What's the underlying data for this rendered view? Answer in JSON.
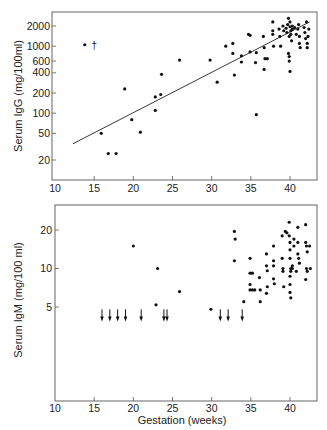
{
  "chart_data": [
    {
      "type": "scatter",
      "panel": "upper",
      "title": "",
      "xlabel": "",
      "ylabel": "Serum IgG (mg/100ml)",
      "xscale": "linear",
      "yscale": "log",
      "xlim": [
        10,
        43
      ],
      "ylim": [
        10,
        3000
      ],
      "xticks": [
        10,
        15,
        20,
        25,
        30,
        35,
        40
      ],
      "yticks": [
        20,
        50,
        100,
        200,
        400,
        600,
        1000,
        2000
      ],
      "grid": false,
      "legend": null,
      "annotations": [
        {
          "text": "†",
          "x": 14.5,
          "y": 1050,
          "note": "dagger mark next to point at ~14 weeks"
        }
      ],
      "regression_line": {
        "from": [
          12.3,
          35
        ],
        "to": [
          42.5,
          2300
        ]
      },
      "points": [
        [
          13.8,
          1050
        ],
        [
          15.9,
          50
        ],
        [
          16.8,
          25
        ],
        [
          17.8,
          25
        ],
        [
          18.9,
          230
        ],
        [
          19.8,
          80
        ],
        [
          20.9,
          52
        ],
        [
          22.8,
          175
        ],
        [
          22.8,
          110
        ],
        [
          23.6,
          380
        ],
        [
          23.5,
          190
        ],
        [
          25.9,
          620
        ],
        [
          29.8,
          620
        ],
        [
          30.7,
          290
        ],
        [
          31.8,
          1000
        ],
        [
          32.7,
          1100
        ],
        [
          32.7,
          780
        ],
        [
          32.9,
          370
        ],
        [
          33.8,
          720
        ],
        [
          33.8,
          580
        ],
        [
          34.7,
          1500
        ],
        [
          34.9,
          1450
        ],
        [
          34.9,
          820
        ],
        [
          35.6,
          570
        ],
        [
          35.7,
          800
        ],
        [
          35.7,
          95
        ],
        [
          36.6,
          1400
        ],
        [
          36.7,
          950
        ],
        [
          36.8,
          650
        ],
        [
          36.7,
          450
        ],
        [
          37.1,
          650
        ],
        [
          37.8,
          2300
        ],
        [
          37.8,
          1700
        ],
        [
          37.8,
          1500
        ],
        [
          37.9,
          1000
        ],
        [
          38.6,
          1800
        ],
        [
          38.7,
          1400
        ],
        [
          38.8,
          1000
        ],
        [
          39.1,
          2000
        ],
        [
          39.2,
          1700
        ],
        [
          39.5,
          1850
        ],
        [
          39.6,
          1600
        ],
        [
          39.7,
          2100
        ],
        [
          39.8,
          2600
        ],
        [
          39.9,
          1400
        ],
        [
          40.0,
          2300
        ],
        [
          40.0,
          1950
        ],
        [
          40.1,
          1700
        ],
        [
          40.1,
          1500
        ],
        [
          40.2,
          1200
        ],
        [
          40.3,
          2000
        ],
        [
          40.3,
          1800
        ],
        [
          39.9,
          600
        ],
        [
          39.9,
          700
        ],
        [
          40.0,
          420
        ],
        [
          39.8,
          780
        ],
        [
          40.6,
          1900
        ],
        [
          40.8,
          1500
        ],
        [
          41.0,
          1800
        ],
        [
          41.1,
          2100
        ],
        [
          41.2,
          1400
        ],
        [
          41.2,
          1100
        ],
        [
          41.3,
          950
        ],
        [
          41.8,
          1900
        ],
        [
          41.9,
          1600
        ],
        [
          42.0,
          1300
        ],
        [
          42.1,
          2300
        ],
        [
          42.2,
          1100
        ],
        [
          42.2,
          950
        ],
        [
          42.3,
          1400
        ],
        [
          42.4,
          1800
        ]
      ]
    },
    {
      "type": "scatter",
      "panel": "lower",
      "title": "",
      "xlabel": "Gestation (weeks)",
      "ylabel": "Serum IgM (mg/100 ml)",
      "xscale": "linear",
      "yscale": "log",
      "xlim": [
        10,
        43
      ],
      "ylim": [
        0.6,
        30
      ],
      "xticks": [
        10,
        15,
        20,
        25,
        30,
        35,
        40
      ],
      "yticks": [
        5,
        10,
        20
      ],
      "grid": false,
      "legend": null,
      "below_detection_arrows_x": [
        16,
        17,
        18,
        19,
        21,
        23.9,
        24.3,
        31.1,
        32.1,
        33.9
      ],
      "below_detection_level": 4.3,
      "points": [
        [
          20.0,
          15
        ],
        [
          23.1,
          10
        ],
        [
          22.9,
          5.2
        ],
        [
          25.9,
          6.6
        ],
        [
          29.9,
          4.8
        ],
        [
          32.9,
          19.5
        ],
        [
          33.0,
          17
        ],
        [
          32.9,
          11.5
        ],
        [
          34.1,
          5.5
        ],
        [
          34.9,
          12
        ],
        [
          34.9,
          9.2
        ],
        [
          35.2,
          9.2
        ],
        [
          34.9,
          7.5
        ],
        [
          34.9,
          6.8
        ],
        [
          35.2,
          6.8
        ],
        [
          35.5,
          6.8
        ],
        [
          36.1,
          8.5
        ],
        [
          36.2,
          6.8
        ],
        [
          36.2,
          5.5
        ],
        [
          37.0,
          13
        ],
        [
          37.0,
          10.5
        ],
        [
          37.1,
          9.6
        ],
        [
          37.1,
          7.2
        ],
        [
          37.0,
          6.4
        ],
        [
          37.9,
          15
        ],
        [
          37.9,
          11.5
        ],
        [
          37.9,
          10.5
        ],
        [
          37.9,
          8.3
        ],
        [
          38.0,
          7.6
        ],
        [
          39.0,
          18
        ],
        [
          39.0,
          12
        ],
        [
          39.1,
          10
        ],
        [
          39.1,
          9.5
        ],
        [
          39.2,
          7.2
        ],
        [
          39.4,
          19.5
        ],
        [
          39.6,
          19
        ],
        [
          39.9,
          23
        ],
        [
          39.9,
          18
        ],
        [
          40.0,
          16
        ],
        [
          40.0,
          14
        ],
        [
          40.0,
          12
        ],
        [
          40.1,
          10
        ],
        [
          40.1,
          9.5
        ],
        [
          40.0,
          8.7
        ],
        [
          40.0,
          7.5
        ],
        [
          40.0,
          6.5
        ],
        [
          40.1,
          5.9
        ],
        [
          40.3,
          10.5
        ],
        [
          40.3,
          10
        ],
        [
          40.5,
          15
        ],
        [
          40.5,
          17
        ],
        [
          40.8,
          9.5
        ],
        [
          41.0,
          21
        ],
        [
          41.0,
          16
        ],
        [
          41.0,
          13
        ],
        [
          41.1,
          12
        ],
        [
          41.2,
          11
        ],
        [
          42.0,
          22
        ],
        [
          42.0,
          16
        ],
        [
          42.1,
          15
        ],
        [
          42.1,
          10
        ],
        [
          42.2,
          9.5
        ],
        [
          42.0,
          8.2
        ],
        [
          42.5,
          15
        ],
        [
          42.6,
          10
        ],
        [
          42.2,
          13.5
        ]
      ]
    }
  ],
  "upper": {
    "ylabel": "Serum IgG (mg/100ml)",
    "xtick_labels": [
      "10",
      "15",
      "20",
      "25",
      "30",
      "35",
      "40"
    ],
    "ytick_labels": [
      "2000",
      "1000",
      "600",
      "400",
      "200",
      "100",
      "50",
      "20"
    ],
    "dagger": "†"
  },
  "lower": {
    "ylabel": "Serum IgM (mg/100 ml)",
    "xlabel": "Gestation (weeks)",
    "xtick_labels": [
      "10",
      "15",
      "20",
      "25",
      "30",
      "35",
      "40"
    ],
    "ytick_labels": [
      "20",
      "10",
      "5"
    ]
  }
}
